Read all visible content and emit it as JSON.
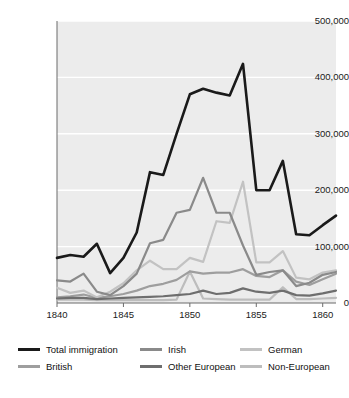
{
  "chart_data": {
    "type": "line",
    "title": "",
    "subtitle": "",
    "xlabel": "",
    "ylabel": "",
    "xlim": [
      1840,
      1861
    ],
    "ylim": [
      0,
      500000
    ],
    "grid": "horizontal-white-gridlines",
    "legend_position": "below-plot",
    "x": [
      1840,
      1841,
      1842,
      1843,
      1844,
      1845,
      1846,
      1847,
      1848,
      1849,
      1850,
      1851,
      1852,
      1853,
      1854,
      1855,
      1856,
      1857,
      1858,
      1859,
      1860,
      1861
    ],
    "y_ticks": [
      0,
      100000,
      200000,
      300000,
      400000,
      500000
    ],
    "y_tick_labels": [
      "0",
      "100,000",
      "200,000",
      "300,000",
      "400,000",
      "500,000"
    ],
    "x_ticks": [
      1840,
      1845,
      1850,
      1855,
      1860
    ],
    "x_tick_labels": [
      "1840",
      "1845",
      "1850",
      "1855",
      "1860"
    ],
    "series": [
      {
        "name": "Total immigration",
        "color": "#1a1a1a",
        "width": 2.6,
        "values": [
          80000,
          85000,
          82000,
          105000,
          53000,
          80000,
          125000,
          232000,
          227000,
          300000,
          370000,
          380000,
          373000,
          368000,
          424000,
          200000,
          200000,
          252000,
          122000,
          120000,
          138000,
          155000
        ]
      },
      {
        "name": "Irish",
        "color": "#8a8a8a",
        "width": 2.2,
        "values": [
          40000,
          38000,
          52000,
          20000,
          14000,
          30000,
          52000,
          106000,
          112000,
          160000,
          165000,
          222000,
          160000,
          160000,
          102000,
          50000,
          55000,
          58000,
          30000,
          36000,
          50000,
          55000
        ]
      },
      {
        "name": "German",
        "color": "#c2c2c2",
        "width": 2.2,
        "values": [
          27000,
          18000,
          22000,
          10000,
          20000,
          35000,
          58000,
          75000,
          60000,
          60000,
          80000,
          73000,
          145000,
          142000,
          215000,
          72000,
          72000,
          92000,
          45000,
          42000,
          54000,
          58000
        ]
      },
      {
        "name": "British",
        "color": "#9e9e9e",
        "width": 2.2,
        "values": [
          10000,
          12000,
          15000,
          9000,
          12000,
          16000,
          22000,
          30000,
          34000,
          41000,
          56000,
          52000,
          54000,
          54000,
          60000,
          48000,
          46000,
          58000,
          38000,
          32000,
          42000,
          52000
        ]
      },
      {
        "name": "Other European",
        "color": "#6e6e6e",
        "width": 2.2,
        "values": [
          8000,
          9000,
          9000,
          7000,
          8000,
          9000,
          10000,
          11000,
          12000,
          14000,
          16000,
          22000,
          16000,
          18000,
          26000,
          20000,
          18000,
          22000,
          14000,
          13000,
          17000,
          22000
        ]
      },
      {
        "name": "Non-European",
        "color": "#bdbdbd",
        "width": 2.2,
        "values": [
          6000,
          6000,
          6000,
          5000,
          5000,
          5000,
          5000,
          5000,
          5000,
          6000,
          56000,
          8000,
          7000,
          6000,
          6000,
          6000,
          6000,
          28000,
          7000,
          7000,
          8000,
          9000
        ]
      }
    ]
  },
  "legend": {
    "rows": [
      [
        {
          "label": "Total immigration",
          "color": "#1a1a1a"
        },
        {
          "label": "Irish",
          "color": "#8a8a8a"
        },
        {
          "label": "German",
          "color": "#c2c2c2"
        }
      ],
      [
        {
          "label": "British",
          "color": "#9e9e9e"
        },
        {
          "label": "Other European",
          "color": "#6e6e6e"
        },
        {
          "label": "Non-European",
          "color": "#bdbdbd"
        }
      ]
    ]
  },
  "plot_style": {
    "background": "#ececec",
    "gridline_color": "#ffffff",
    "axis_color": "#6b6b6b",
    "page_background": "#ffffff"
  }
}
